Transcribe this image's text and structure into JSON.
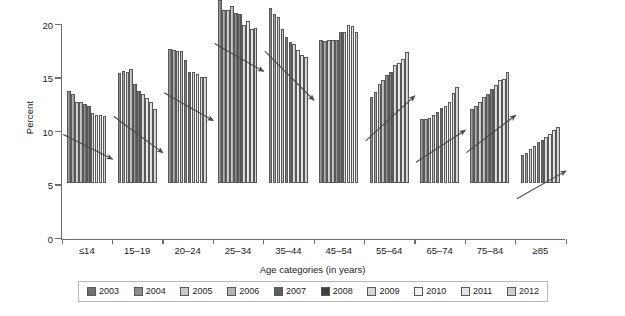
{
  "chart_data": {
    "type": "bar",
    "title": "",
    "subtitle": "",
    "xlabel": "Age categories (in years)",
    "ylabel": "Percent",
    "ylim": [
      0,
      20
    ],
    "yticks": [
      0,
      5,
      10,
      15,
      20
    ],
    "ytick_labels": [
      "0",
      "5",
      "10",
      "15",
      "20"
    ],
    "grid": false,
    "legend_position": "bottom",
    "categories": [
      "≤14",
      "15–19",
      "20–24",
      "25–34",
      "35–44",
      "45–54",
      "55–64",
      "65–74",
      "75–84",
      "≥85"
    ],
    "series": [
      {
        "name": "2003",
        "color": "#6f6f6f",
        "values": [
          8.6,
          10.3,
          12.5,
          17.1,
          16.4,
          13.4,
          8.0,
          6.0,
          6.9,
          2.6
        ]
      },
      {
        "name": "2004",
        "color": "#8d8d8d",
        "values": [
          8.3,
          10.5,
          12.4,
          16.2,
          15.8,
          13.3,
          8.5,
          6.0,
          7.2,
          2.8
        ]
      },
      {
        "name": "2005",
        "color": "#c9c9c9",
        "values": [
          7.6,
          10.4,
          12.3,
          16.2,
          15.5,
          13.4,
          9.3,
          6.1,
          7.6,
          3.2
        ]
      },
      {
        "name": "2006",
        "color": "#b3b3b3",
        "values": [
          7.6,
          10.7,
          12.3,
          16.5,
          14.4,
          13.4,
          9.6,
          6.4,
          8.0,
          3.5
        ]
      },
      {
        "name": "2007",
        "color": "#5d5d5d",
        "values": [
          7.4,
          9.3,
          11.5,
          15.9,
          13.6,
          13.4,
          10.1,
          6.6,
          8.3,
          3.8
        ]
      },
      {
        "name": "2008",
        "color": "#3f3f3f",
        "values": [
          7.2,
          8.6,
          10.4,
          15.8,
          13.2,
          14.1,
          10.4,
          7.0,
          8.8,
          4.0
        ]
      },
      {
        "name": "2009",
        "color": "#d6d6d6",
        "values": [
          6.5,
          8.3,
          10.4,
          14.8,
          13.0,
          14.1,
          11.0,
          7.2,
          9.2,
          4.3
        ]
      },
      {
        "name": "2010",
        "color": "#efefef",
        "values": [
          6.4,
          7.9,
          10.2,
          15.1,
          12.4,
          14.8,
          11.2,
          7.6,
          9.6,
          4.6
        ]
      },
      {
        "name": "2011",
        "color": "#e4e4e4",
        "values": [
          6.4,
          7.6,
          9.9,
          14.4,
          12.0,
          14.7,
          11.6,
          8.4,
          9.7,
          5.0
        ]
      },
      {
        "name": "2012",
        "color": "#cfcfcf",
        "values": [
          6.3,
          6.9,
          9.9,
          14.5,
          11.8,
          14.1,
          12.2,
          9.0,
          10.4,
          5.2
        ]
      }
    ],
    "annotations": [
      {
        "type": "arrow",
        "group": "≤14",
        "direction": "down",
        "note": "decreasing trend 2003–2012"
      },
      {
        "type": "arrow",
        "group": "15–19",
        "direction": "down",
        "note": "decreasing trend 2003–2012"
      },
      {
        "type": "arrow",
        "group": "20–24",
        "direction": "down",
        "note": "decreasing trend 2003–2012"
      },
      {
        "type": "arrow",
        "group": "25–34",
        "direction": "down",
        "note": "decreasing trend 2003–2012"
      },
      {
        "type": "arrow",
        "group": "35–44",
        "direction": "down",
        "note": "decreasing trend 2003–2012"
      },
      {
        "type": "arrow",
        "group": "55–64",
        "direction": "up",
        "note": "increasing trend 2003–2012"
      },
      {
        "type": "arrow",
        "group": "65–74",
        "direction": "up",
        "note": "increasing trend 2003–2012"
      },
      {
        "type": "arrow",
        "group": "75–84",
        "direction": "up",
        "note": "increasing trend 2003–2012"
      },
      {
        "type": "arrow",
        "group": "≥85",
        "direction": "up",
        "note": "increasing trend 2003–2012"
      }
    ]
  },
  "legend": {
    "items": [
      {
        "label": "2003"
      },
      {
        "label": "2004"
      },
      {
        "label": "2005"
      },
      {
        "label": "2006"
      },
      {
        "label": "2007"
      },
      {
        "label": "2008"
      },
      {
        "label": "2009"
      },
      {
        "label": "2010"
      },
      {
        "label": "2011"
      },
      {
        "label": "2012"
      }
    ]
  },
  "style": {
    "axis_color": "#6e6e6e",
    "bar_outline": "#58585a",
    "arrow_color": "#4a4a4a",
    "legend_border": "#b9b9b9",
    "background": "#ffffff"
  }
}
